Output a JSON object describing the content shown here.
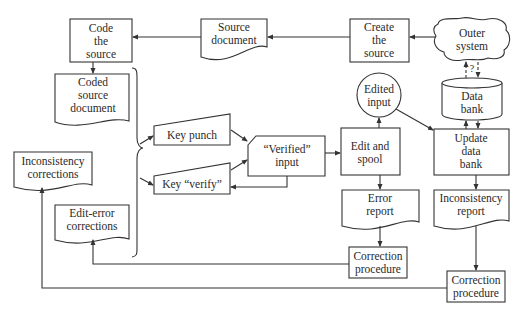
{
  "diagram": {
    "type": "flowchart",
    "nodes": {
      "code_source": {
        "shape": "process",
        "lines": [
          "Code",
          "the",
          "source"
        ]
      },
      "source_document": {
        "shape": "document",
        "lines": [
          "Source",
          "document"
        ]
      },
      "create_source": {
        "shape": "process",
        "lines": [
          "Create",
          "the",
          "source"
        ]
      },
      "outer_system": {
        "shape": "cloud",
        "lines": [
          "Outer",
          "system"
        ]
      },
      "coded_source_document": {
        "shape": "document",
        "lines": [
          "Coded",
          "source",
          "document"
        ]
      },
      "key_punch": {
        "shape": "manual-input",
        "lines": [
          "Key punch"
        ]
      },
      "key_verify": {
        "shape": "manual-input",
        "lines": [
          "Key “verify”"
        ]
      },
      "verified_input": {
        "shape": "process",
        "lines": [
          "“Verified”",
          "input"
        ]
      },
      "edit_spool": {
        "shape": "process",
        "lines": [
          "Edit and",
          "spool"
        ]
      },
      "edited_input": {
        "shape": "connector-circle",
        "lines": [
          "Edited",
          "input"
        ]
      },
      "data_bank": {
        "shape": "storage-cylinder",
        "lines": [
          "Data",
          "bank"
        ]
      },
      "update_data_bank": {
        "shape": "process",
        "lines": [
          "Update",
          "data",
          "bank"
        ]
      },
      "error_report": {
        "shape": "document",
        "lines": [
          "Error",
          "report"
        ]
      },
      "inconsistency_report": {
        "shape": "document",
        "lines": [
          "Inconsistency",
          "report"
        ]
      },
      "correction_procedure_1": {
        "shape": "process",
        "lines": [
          "Correction",
          "procedure"
        ]
      },
      "correction_procedure_2": {
        "shape": "process",
        "lines": [
          "Correction",
          "procedure"
        ]
      },
      "inconsistency_corrections": {
        "shape": "document",
        "lines": [
          "Inconsistency",
          "corrections"
        ]
      },
      "edit_error_corrections": {
        "shape": "document",
        "lines": [
          "Edit-error",
          "corrections"
        ]
      }
    },
    "question_mark": "?",
    "edges": [
      {
        "from": "outer_system",
        "to": "create_source"
      },
      {
        "from": "create_source",
        "to": "source_document"
      },
      {
        "from": "source_document",
        "to": "code_source"
      },
      {
        "from": "code_source",
        "to": "coded_source_document"
      },
      {
        "from": "coded_source_document",
        "to": "key_punch",
        "via": "brace"
      },
      {
        "from": "coded_source_document",
        "to": "key_verify",
        "via": "brace"
      },
      {
        "from": "key_punch",
        "to": "verified_input"
      },
      {
        "from": "key_verify",
        "to": "verified_input"
      },
      {
        "from": "verified_input",
        "to": "key_verify"
      },
      {
        "from": "verified_input",
        "to": "edit_spool"
      },
      {
        "from": "edit_spool",
        "to": "edited_input"
      },
      {
        "from": "edited_input",
        "to": "update_data_bank"
      },
      {
        "from": "update_data_bank",
        "to": "data_bank",
        "bidirectional": true
      },
      {
        "from": "data_bank",
        "to": "outer_system",
        "style": "dashed",
        "label": "?"
      },
      {
        "from": "edit_spool",
        "to": "error_report"
      },
      {
        "from": "error_report",
        "to": "correction_procedure_1"
      },
      {
        "from": "correction_procedure_1",
        "to": "edit_error_corrections"
      },
      {
        "from": "update_data_bank",
        "to": "inconsistency_report"
      },
      {
        "from": "inconsistency_report",
        "to": "correction_procedure_2"
      },
      {
        "from": "correction_procedure_2",
        "to": "inconsistency_corrections"
      }
    ]
  }
}
